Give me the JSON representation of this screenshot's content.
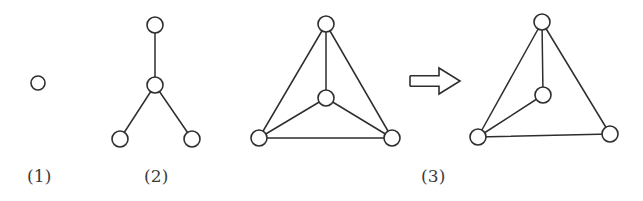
{
  "figure": {
    "background_color": "#ffffff",
    "stroke_color": "#2e2e2e",
    "node_fill_color": "#ffffff",
    "caption_color": "#3b3b3b",
    "panels": [
      {
        "id": "panel-1",
        "caption": "(1)",
        "caption_x": 27,
        "caption_y": 168,
        "node_radius": 7,
        "nodes": [
          {
            "id": "p1-n1",
            "cx": 38,
            "cy": 83
          }
        ],
        "edges": []
      },
      {
        "id": "panel-2",
        "caption": "(2)",
        "caption_x": 144,
        "caption_y": 168,
        "node_radius": 8,
        "nodes": [
          {
            "id": "p2-top",
            "cx": 155,
            "cy": 25
          },
          {
            "id": "p2-center",
            "cx": 155,
            "cy": 85
          },
          {
            "id": "p2-bottom-left",
            "cx": 120,
            "cy": 139
          },
          {
            "id": "p2-bottom-right",
            "cx": 192,
            "cy": 139
          }
        ],
        "edges": [
          {
            "from": "p2-top",
            "to": "p2-center"
          },
          {
            "from": "p2-center",
            "to": "p2-bottom-left"
          },
          {
            "from": "p2-center",
            "to": "p2-bottom-right"
          }
        ]
      },
      {
        "id": "panel-3-left",
        "caption": "(3)",
        "caption_x": 421,
        "caption_y": 168,
        "node_radius": 8,
        "nodes": [
          {
            "id": "p3l-top",
            "cx": 326,
            "cy": 24
          },
          {
            "id": "p3l-center",
            "cx": 326,
            "cy": 98
          },
          {
            "id": "p3l-bottom-left",
            "cx": 259,
            "cy": 138
          },
          {
            "id": "p3l-bottom-right",
            "cx": 392,
            "cy": 138
          }
        ],
        "edges": [
          {
            "from": "p3l-top",
            "to": "p3l-center"
          },
          {
            "from": "p3l-top",
            "to": "p3l-bottom-left"
          },
          {
            "from": "p3l-top",
            "to": "p3l-bottom-right"
          },
          {
            "from": "p3l-center",
            "to": "p3l-bottom-left"
          },
          {
            "from": "p3l-center",
            "to": "p3l-bottom-right"
          },
          {
            "from": "p3l-bottom-left",
            "to": "p3l-bottom-right"
          }
        ]
      },
      {
        "id": "panel-3-right",
        "caption": "",
        "node_radius": 8,
        "nodes": [
          {
            "id": "p3r-top",
            "cx": 542,
            "cy": 22
          },
          {
            "id": "p3r-center",
            "cx": 543,
            "cy": 95
          },
          {
            "id": "p3r-bottom-left",
            "cx": 478,
            "cy": 137
          },
          {
            "id": "p3r-bottom-right",
            "cx": 610,
            "cy": 134
          }
        ],
        "edges": [
          {
            "from": "p3r-top",
            "to": "p3r-center"
          },
          {
            "from": "p3r-top",
            "to": "p3r-bottom-left"
          },
          {
            "from": "p3r-top",
            "to": "p3r-bottom-right"
          },
          {
            "from": "p3r-center",
            "to": "p3r-bottom-left"
          },
          {
            "from": "p3r-bottom-left",
            "to": "p3r-bottom-right"
          }
        ]
      }
    ],
    "arrow": {
      "symbol": "double-right-arrow",
      "label": "⇒",
      "x": 410,
      "y": 68,
      "width": 50,
      "height": 26
    }
  }
}
